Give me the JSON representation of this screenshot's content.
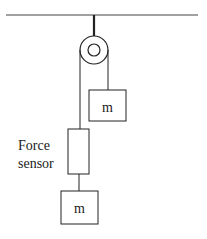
{
  "diagram": {
    "type": "pulley-system",
    "labels": {
      "sensor_line1": "Force",
      "sensor_line2": "sensor",
      "mass_right": "m",
      "mass_bottom": "m"
    },
    "colors": {
      "stroke": "#222222",
      "background": "#ffffff"
    }
  }
}
